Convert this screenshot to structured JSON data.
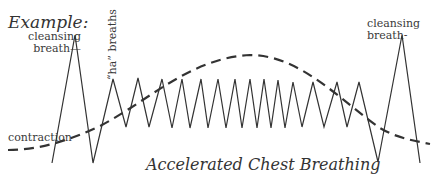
{
  "heading": "Example:",
  "caption": "Accelerated Chest Breathing",
  "labels": {
    "cleansing_start": [
      "cleansing",
      "breath—"
    ],
    "cleansing_end": [
      "cleansing",
      "breath-"
    ],
    "ha_breaths": "“ha” breaths",
    "contraction": "contraction"
  },
  "series": {
    "breathing": {
      "style": "solid",
      "description": "breath pattern: cleansing breath, accelerating shallow 'ha' breaths peaking mid-contraction, cleansing breath",
      "phases": [
        "cleansing breath",
        "ha breaths",
        "accelerated breaths",
        "ha breaths",
        "cleansing breath"
      ]
    },
    "contraction": {
      "style": "dashed",
      "description": "contraction intensity curve rising to peak and falling"
    }
  },
  "colors": {
    "ink": "#333333",
    "background": "#ffffff"
  }
}
